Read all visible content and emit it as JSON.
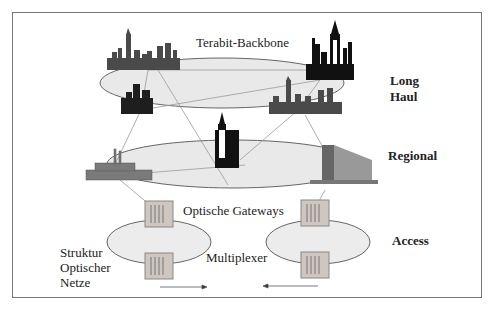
{
  "diagram": {
    "caption": {
      "line1": "Struktur",
      "line2": "Optischer",
      "line3": "Netze"
    },
    "labels": {
      "backbone": "Terabit-Backbone",
      "gateways": "Optische Gateways",
      "multiplexer": "Multiplexer"
    },
    "layers": {
      "long_haul": {
        "line1": "Long",
        "line2": "Haul"
      },
      "regional": "Regional",
      "access": "Access"
    },
    "nodes": [
      "city-skyline",
      "statue-of-liberty-skyline",
      "small-city",
      "city-skyline-2",
      "tower",
      "factory",
      "office-building",
      "gateway-rack-left",
      "gateway-rack-right",
      "multiplexer-rack-left",
      "multiplexer-rack-right"
    ],
    "colors": {
      "ellipse_fill": "#e9e9e9",
      "ellipse_stroke": "#666666",
      "link": "#999999",
      "building_dark": "#222222",
      "building_gray": "#555555"
    }
  }
}
